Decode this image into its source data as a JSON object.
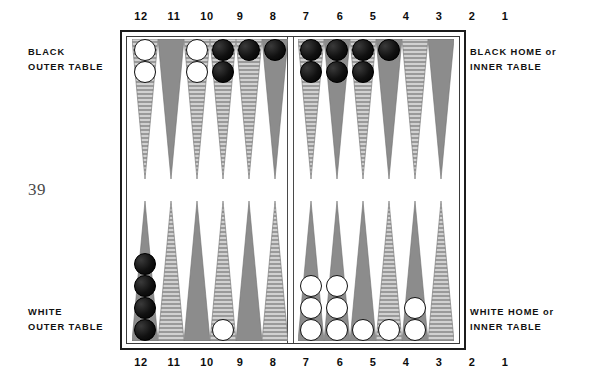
{
  "page_number": "39",
  "labels": {
    "black_outer": {
      "line1": "BLACK",
      "line2": "OUTER TABLE"
    },
    "black_home": {
      "line1": "BLACK HOME or",
      "line2": "INNER TABLE"
    },
    "white_outer": {
      "line1": "WHITE",
      "line2": "OUTER TABLE"
    },
    "white_home": {
      "line1": "WHITE HOME or",
      "line2": "INNER TABLE"
    }
  },
  "point_numbers": {
    "left_group": [
      "12",
      "11",
      "10",
      "9",
      "8",
      "7"
    ],
    "right_group": [
      "6",
      "5",
      "4",
      "3",
      "2",
      "1"
    ]
  },
  "colors": {
    "checker_white": "#ffffff",
    "checker_black": "#1a1a1a",
    "point_gray": "#8c8c8c",
    "point_striped": "#9a9a9a",
    "border": "#1c1c1c",
    "background": "#ffffff",
    "text": "#0d0d0d",
    "page_number": "#4a4a4a"
  },
  "board": {
    "quadrants": {
      "top_left": {
        "name": "BLACK OUTER TABLE",
        "points": [
          {
            "number": "12",
            "style": "striped",
            "checkers": 2,
            "color": "white"
          },
          {
            "number": "11",
            "style": "solid",
            "checkers": 0,
            "color": "none"
          },
          {
            "number": "10",
            "style": "striped",
            "checkers": 2,
            "color": "white"
          },
          {
            "number": "9",
            "style": "striped",
            "checkers": 2,
            "color": "black"
          },
          {
            "number": "8",
            "style": "striped",
            "checkers": 1,
            "color": "black"
          },
          {
            "number": "7",
            "style": "solid",
            "checkers": 1,
            "color": "black"
          }
        ]
      },
      "top_right": {
        "name": "BLACK HOME or INNER TABLE",
        "points": [
          {
            "number": "6",
            "style": "striped",
            "checkers": 2,
            "color": "black"
          },
          {
            "number": "5",
            "style": "solid",
            "checkers": 2,
            "color": "black"
          },
          {
            "number": "4",
            "style": "striped",
            "checkers": 2,
            "color": "black"
          },
          {
            "number": "3",
            "style": "solid",
            "checkers": 1,
            "color": "black"
          },
          {
            "number": "2",
            "style": "striped",
            "checkers": 0,
            "color": "none"
          },
          {
            "number": "1",
            "style": "solid",
            "checkers": 0,
            "color": "none"
          }
        ]
      },
      "bottom_left": {
        "name": "WHITE OUTER TABLE",
        "points": [
          {
            "number": "12",
            "style": "solid",
            "checkers": 4,
            "color": "black"
          },
          {
            "number": "11",
            "style": "striped",
            "checkers": 0,
            "color": "none"
          },
          {
            "number": "10",
            "style": "solid",
            "checkers": 0,
            "color": "none"
          },
          {
            "number": "9",
            "style": "striped",
            "checkers": 1,
            "color": "white"
          },
          {
            "number": "8",
            "style": "solid",
            "checkers": 0,
            "color": "none"
          },
          {
            "number": "7",
            "style": "striped",
            "checkers": 0,
            "color": "none"
          }
        ]
      },
      "bottom_right": {
        "name": "WHITE HOME or INNER TABLE",
        "points": [
          {
            "number": "6",
            "style": "solid",
            "checkers": 3,
            "color": "white"
          },
          {
            "number": "5",
            "style": "solid",
            "checkers": 3,
            "color": "white"
          },
          {
            "number": "4",
            "style": "solid",
            "checkers": 1,
            "color": "white"
          },
          {
            "number": "3",
            "style": "striped",
            "checkers": 1,
            "color": "white"
          },
          {
            "number": "2",
            "style": "solid",
            "checkers": 2,
            "color": "white"
          },
          {
            "number": "1",
            "style": "striped",
            "checkers": 0,
            "color": "none"
          }
        ]
      }
    }
  }
}
